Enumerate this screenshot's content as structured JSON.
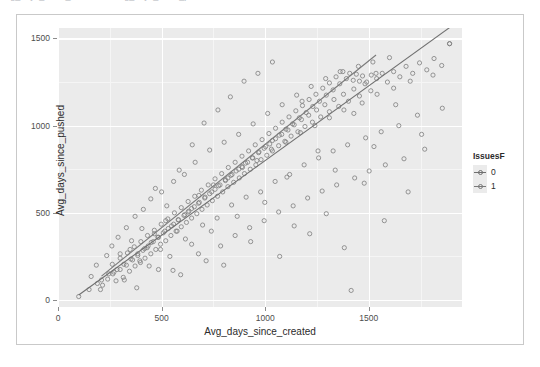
{
  "clipped_header": {
    "text": "Avg_days_since_created  vs  Avg_days_since_pushed"
  },
  "axes": {
    "x_title": "Avg_days_since_created",
    "y_title": "Avg_days_since_pushed",
    "x_ticks": [
      "0",
      "500",
      "1000",
      "1500"
    ],
    "y_ticks": [
      "0",
      "500",
      "1000",
      "1500"
    ]
  },
  "legend": {
    "title": "IssuesF",
    "items": [
      {
        "label": "0",
        "color": "#6f6f6f"
      },
      {
        "label": "1",
        "color": "#7a7a7a"
      }
    ]
  },
  "chart_data": {
    "type": "scatter",
    "title": "",
    "subtitle": "",
    "xlabel": "Avg_days_since_created",
    "ylabel": "Avg_days_since_pushed",
    "xlim": [
      0,
      1950
    ],
    "ylim": [
      -40,
      1560
    ],
    "x_ticks": [
      0,
      500,
      1000,
      1500
    ],
    "y_ticks": [
      0,
      500,
      1000,
      1500
    ],
    "grid": true,
    "legend_position": "right",
    "legend_title": "IssuesF",
    "point_shape": "open-circle",
    "point_color": "#7d7d7d",
    "panel_background": "#ebebeb",
    "gridline_color": "#ffffff",
    "series": [
      {
        "name": "0",
        "color": "#6f6f6f",
        "points": [
          [
            100,
            20
          ],
          [
            150,
            60
          ],
          [
            190,
            95
          ],
          [
            205,
            60
          ],
          [
            240,
            120
          ],
          [
            265,
            150
          ],
          [
            280,
            110
          ],
          [
            300,
            175
          ],
          [
            315,
            130
          ],
          [
            330,
            200
          ],
          [
            345,
            165
          ],
          [
            360,
            230
          ],
          [
            372,
            195
          ],
          [
            385,
            255
          ],
          [
            398,
            215
          ],
          [
            410,
            285
          ],
          [
            420,
            240
          ],
          [
            435,
            310
          ],
          [
            448,
            265
          ],
          [
            460,
            335
          ],
          [
            472,
            290
          ],
          [
            485,
            360
          ],
          [
            495,
            320
          ],
          [
            508,
            385
          ],
          [
            520,
            340
          ],
          [
            532,
            410
          ],
          [
            545,
            370
          ],
          [
            558,
            435
          ],
          [
            570,
            395
          ],
          [
            582,
            460
          ],
          [
            595,
            420
          ],
          [
            608,
            485
          ],
          [
            620,
            445
          ],
          [
            632,
            510
          ],
          [
            645,
            470
          ],
          [
            658,
            535
          ],
          [
            670,
            495
          ],
          [
            682,
            560
          ],
          [
            695,
            520
          ],
          [
            708,
            585
          ],
          [
            720,
            545
          ],
          [
            732,
            610
          ],
          [
            745,
            570
          ],
          [
            758,
            635
          ],
          [
            770,
            595
          ],
          [
            782,
            660
          ],
          [
            795,
            620
          ],
          [
            808,
            690
          ],
          [
            820,
            650
          ],
          [
            835,
            715
          ],
          [
            848,
            675
          ],
          [
            860,
            740
          ],
          [
            875,
            700
          ],
          [
            888,
            765
          ],
          [
            900,
            725
          ],
          [
            915,
            790
          ],
          [
            928,
            750
          ],
          [
            940,
            815
          ],
          [
            955,
            775
          ],
          [
            968,
            845
          ],
          [
            980,
            805
          ],
          [
            995,
            870
          ],
          [
            1008,
            830
          ],
          [
            1022,
            895
          ],
          [
            1035,
            855
          ],
          [
            1050,
            925
          ],
          [
            1065,
            885
          ],
          [
            1080,
            950
          ],
          [
            1095,
            910
          ],
          [
            1110,
            975
          ],
          [
            1125,
            940
          ],
          [
            1140,
            1005
          ],
          [
            1158,
            965
          ],
          [
            1175,
            1035
          ],
          [
            1192,
            995
          ],
          [
            1210,
            1060
          ],
          [
            1228,
            1020
          ],
          [
            1248,
            1090
          ],
          [
            1268,
            1050
          ],
          [
            1288,
            1120
          ],
          [
            1310,
            1080
          ],
          [
            1332,
            1150
          ],
          [
            1355,
            1110
          ],
          [
            1378,
            1180
          ],
          [
            1402,
            1140
          ],
          [
            1428,
            1210
          ],
          [
            1455,
            1170
          ],
          [
            1482,
            1240
          ],
          [
            1510,
            1200
          ],
          [
            1538,
            1270
          ],
          [
            1565,
            1300
          ],
          [
            1590,
            1250
          ],
          [
            1620,
            1310
          ],
          [
            1650,
            1280
          ],
          [
            1680,
            1340
          ],
          [
            1712,
            1300
          ],
          [
            1745,
            1360
          ],
          [
            1780,
            1320
          ],
          [
            1815,
            1385
          ],
          [
            1852,
            1345
          ],
          [
            1890,
            1470
          ]
        ]
      },
      {
        "name": "1",
        "color": "#7a7a7a",
        "points": [
          [
            210,
            115
          ],
          [
            245,
            150
          ],
          [
            262,
            205
          ],
          [
            285,
            175
          ],
          [
            300,
            240
          ],
          [
            318,
            205
          ],
          [
            335,
            270
          ],
          [
            352,
            235
          ],
          [
            368,
            305
          ],
          [
            385,
            265
          ],
          [
            400,
            335
          ],
          [
            418,
            295
          ],
          [
            432,
            370
          ],
          [
            450,
            330
          ],
          [
            465,
            400
          ],
          [
            482,
            360
          ],
          [
            498,
            435
          ],
          [
            515,
            395
          ],
          [
            530,
            465
          ],
          [
            548,
            425
          ],
          [
            562,
            500
          ],
          [
            580,
            460
          ],
          [
            595,
            530
          ],
          [
            612,
            490
          ],
          [
            628,
            565
          ],
          [
            645,
            525
          ],
          [
            660,
            595
          ],
          [
            678,
            555
          ],
          [
            692,
            630
          ],
          [
            710,
            590
          ],
          [
            725,
            660
          ],
          [
            742,
            620
          ],
          [
            758,
            695
          ],
          [
            775,
            655
          ],
          [
            790,
            725
          ],
          [
            808,
            685
          ],
          [
            822,
            760
          ],
          [
            840,
            720
          ],
          [
            855,
            790
          ],
          [
            872,
            750
          ],
          [
            888,
            825
          ],
          [
            905,
            785
          ],
          [
            920,
            855
          ],
          [
            938,
            815
          ],
          [
            952,
            890
          ],
          [
            970,
            850
          ],
          [
            985,
            920
          ],
          [
            1002,
            880
          ],
          [
            1018,
            955
          ],
          [
            1035,
            915
          ],
          [
            1050,
            985
          ],
          [
            1068,
            945
          ],
          [
            1082,
            1020
          ],
          [
            1100,
            980
          ],
          [
            1115,
            1050
          ],
          [
            1132,
            1010
          ],
          [
            1148,
            1085
          ],
          [
            1165,
            1045
          ],
          [
            1180,
            1115
          ],
          [
            1198,
            1075
          ],
          [
            1212,
            1150
          ],
          [
            1230,
            1110
          ],
          [
            1245,
            1180
          ],
          [
            1262,
            1140
          ],
          [
            1278,
            1215
          ],
          [
            1295,
            1175
          ],
          [
            1310,
            1245
          ],
          [
            1328,
            1205
          ],
          [
            1342,
            1280
          ],
          [
            1360,
            1240
          ],
          [
            1375,
            1310
          ],
          [
            1392,
            1270
          ],
          [
            1408,
            1300
          ],
          [
            1425,
            1260
          ],
          [
            1440,
            1295
          ],
          [
            1455,
            1255
          ],
          [
            1470,
            1285
          ],
          [
            1490,
            1250
          ],
          [
            1512,
            1290
          ],
          [
            1535,
            1300
          ]
        ]
      }
    ],
    "scatter_cloud": [
      [
        260,
        310
      ],
      [
        300,
        265
      ],
      [
        330,
        415
      ],
      [
        355,
        340
      ],
      [
        372,
        480
      ],
      [
        395,
        225
      ],
      [
        412,
        520
      ],
      [
        430,
        300
      ],
      [
        448,
        580
      ],
      [
        465,
        380
      ],
      [
        485,
        175
      ],
      [
        500,
        620
      ],
      [
        520,
        455
      ],
      [
        540,
        250
      ],
      [
        558,
        680
      ],
      [
        575,
        395
      ],
      [
        592,
        145
      ],
      [
        610,
        720
      ],
      [
        628,
        505
      ],
      [
        645,
        320
      ],
      [
        662,
        790
      ],
      [
        680,
        600
      ],
      [
        698,
        430
      ],
      [
        715,
        225
      ],
      [
        732,
        860
      ],
      [
        750,
        660
      ],
      [
        768,
        470
      ],
      [
        785,
        310
      ],
      [
        802,
        905
      ],
      [
        820,
        700
      ],
      [
        838,
        545
      ],
      [
        855,
        370
      ],
      [
        872,
        950
      ],
      [
        890,
        760
      ],
      [
        908,
        590
      ],
      [
        925,
        415
      ],
      [
        942,
        1010
      ],
      [
        960,
        800
      ],
      [
        978,
        620
      ],
      [
        995,
        455
      ],
      [
        1012,
        1070
      ],
      [
        1030,
        865
      ],
      [
        1048,
        680
      ],
      [
        1065,
        505
      ],
      [
        1082,
        1120
      ],
      [
        1100,
        905
      ],
      [
        1118,
        720
      ],
      [
        1135,
        540
      ],
      [
        1152,
        1175
      ],
      [
        1170,
        960
      ],
      [
        1188,
        775
      ],
      [
        1205,
        585
      ],
      [
        1222,
        1225
      ],
      [
        1240,
        1000
      ],
      [
        1258,
        815
      ],
      [
        1275,
        625
      ],
      [
        1292,
        1270
      ],
      [
        1310,
        1045
      ],
      [
        1328,
        855
      ],
      [
        1345,
        660
      ],
      [
        1362,
        1310
      ],
      [
        1380,
        1090
      ],
      [
        1398,
        890
      ],
      [
        1415,
        55
      ],
      [
        1432,
        700
      ],
      [
        1450,
        1340
      ],
      [
        1468,
        1130
      ],
      [
        1485,
        930
      ],
      [
        1502,
        740
      ],
      [
        1520,
        1365
      ],
      [
        1540,
        1180
      ],
      [
        1560,
        965
      ],
      [
        1580,
        775
      ],
      [
        1600,
        1390
      ],
      [
        1620,
        1215
      ],
      [
        1645,
        1000
      ],
      [
        1670,
        810
      ],
      [
        1700,
        1255
      ],
      [
        1735,
        1060
      ],
      [
        1770,
        865
      ],
      [
        1810,
        1290
      ],
      [
        1855,
        1100
      ],
      [
        1890,
        1470
      ],
      [
        160,
        135
      ],
      [
        185,
        200
      ],
      [
        215,
        85
      ],
      [
        235,
        255
      ],
      [
        270,
        160
      ],
      [
        290,
        360
      ],
      [
        320,
        115
      ],
      [
        348,
        290
      ],
      [
        380,
        70
      ],
      [
        405,
        410
      ],
      [
        440,
        195
      ],
      [
        470,
        640
      ],
      [
        495,
        290
      ],
      [
        525,
        540
      ],
      [
        555,
        170
      ],
      [
        585,
        745
      ],
      [
        615,
        350
      ],
      [
        648,
        890
      ],
      [
        678,
        265
      ],
      [
        705,
        1015
      ],
      [
        740,
        395
      ],
      [
        772,
        1090
      ],
      [
        800,
        200
      ],
      [
        832,
        1165
      ],
      [
        865,
        480
      ],
      [
        898,
        1255
      ],
      [
        930,
        335
      ],
      [
        965,
        1300
      ],
      [
        998,
        560
      ],
      [
        1035,
        1365
      ],
      [
        1070,
        250
      ],
      [
        1105,
        705
      ],
      [
        1140,
        425
      ],
      [
        1178,
        1140
      ],
      [
        1215,
        380
      ],
      [
        1255,
        855
      ],
      [
        1295,
        495
      ],
      [
        1338,
        745
      ],
      [
        1382,
        300
      ],
      [
        1428,
        1070
      ],
      [
        1478,
        670
      ],
      [
        1525,
        880
      ],
      [
        1575,
        455
      ],
      [
        1630,
        1120
      ],
      [
        1690,
        620
      ],
      [
        1755,
        950
      ]
    ]
  }
}
